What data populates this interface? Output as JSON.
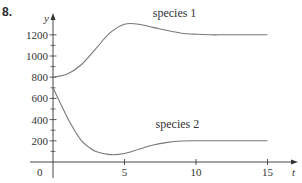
{
  "problem_number": "8.",
  "chart_data": {
    "type": "line",
    "title": "",
    "xlabel": "t",
    "ylabel": "y",
    "xlim": [
      0,
      16
    ],
    "ylim": [
      0,
      1300
    ],
    "x_ticks": [
      5,
      10,
      15
    ],
    "x_tick_labels": [
      "5",
      "10",
      "15"
    ],
    "y_ticks": [
      200,
      400,
      600,
      800,
      1000,
      1200
    ],
    "y_tick_labels": [
      "200",
      "400",
      "600",
      "800",
      "1000",
      "1200"
    ],
    "y_minor_ticks": [
      100,
      300,
      500,
      700,
      900,
      1100
    ],
    "origin_label": "0",
    "grid": false,
    "legend": "inline labels",
    "series": [
      {
        "name": "species 1",
        "label_position": {
          "t": 8.5,
          "v": 1370
        },
        "x": [
          0,
          1,
          2,
          3,
          4,
          5,
          6,
          7,
          8,
          9,
          10,
          11,
          12,
          13,
          14,
          15
        ],
        "values": [
          800,
          830,
          920,
          1070,
          1220,
          1300,
          1300,
          1270,
          1240,
          1215,
          1205,
          1200,
          1200,
          1200,
          1200,
          1200
        ]
      },
      {
        "name": "species 2",
        "label_position": {
          "t": 8.7,
          "v": 320
        },
        "x": [
          0,
          0.5,
          1,
          1.5,
          2,
          2.5,
          3,
          4,
          5,
          6,
          7,
          8,
          9,
          10,
          12,
          15
        ],
        "values": [
          700,
          560,
          420,
          300,
          200,
          140,
          100,
          70,
          80,
          120,
          160,
          185,
          198,
          200,
          200,
          200
        ]
      }
    ]
  },
  "colors": {
    "axis": "#333333",
    "curve": "#777777",
    "text": "#333333"
  }
}
